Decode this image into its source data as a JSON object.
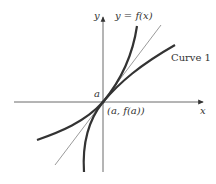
{
  "diagram": {
    "axes": {
      "x_label": "x",
      "y_label": "y"
    },
    "point": {
      "tick_label": "a",
      "coord_label": "(a, f(a))"
    },
    "curves": [
      {
        "name": "y = f(x)",
        "label": "y = f(x)"
      },
      {
        "name": "Curve 1",
        "label": "Curve 1"
      }
    ],
    "tangent_line": {
      "label": ""
    },
    "colors": {
      "curve": "#333333",
      "axis": "#444444",
      "tangent": "#555555"
    }
  }
}
